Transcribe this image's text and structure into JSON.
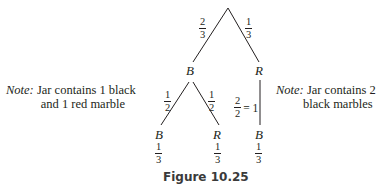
{
  "diagram": {
    "type": "probability-tree",
    "root": {
      "branches": [
        {
          "label_num": "2",
          "label_den": "3",
          "node": "B"
        },
        {
          "label_num": "1",
          "label_den": "3",
          "node": "R"
        }
      ]
    },
    "level2": {
      "from_B": [
        {
          "label_num": "1",
          "label_den": "2",
          "node": "B",
          "prob_num": "1",
          "prob_den": "3"
        },
        {
          "label_num": "1",
          "label_den": "2",
          "node": "R",
          "prob_num": "1",
          "prob_den": "3"
        }
      ],
      "from_R": [
        {
          "label_num": "2",
          "label_den": "2",
          "label_eq": "= 1",
          "node": "B",
          "prob_num": "1",
          "prob_den": "3"
        }
      ]
    },
    "notes": {
      "left": {
        "keyword": "Note:",
        "line1": "Jar contains 1 black",
        "line2": "and 1 red marble"
      },
      "right": {
        "keyword": "Note:",
        "line1": "Jar contains 2",
        "line2": "black marbles"
      }
    },
    "caption": "Figure 10.25",
    "colors": {
      "ink": "#231f20",
      "caption": "#3a3a3a",
      "background": "#ffffff"
    }
  }
}
